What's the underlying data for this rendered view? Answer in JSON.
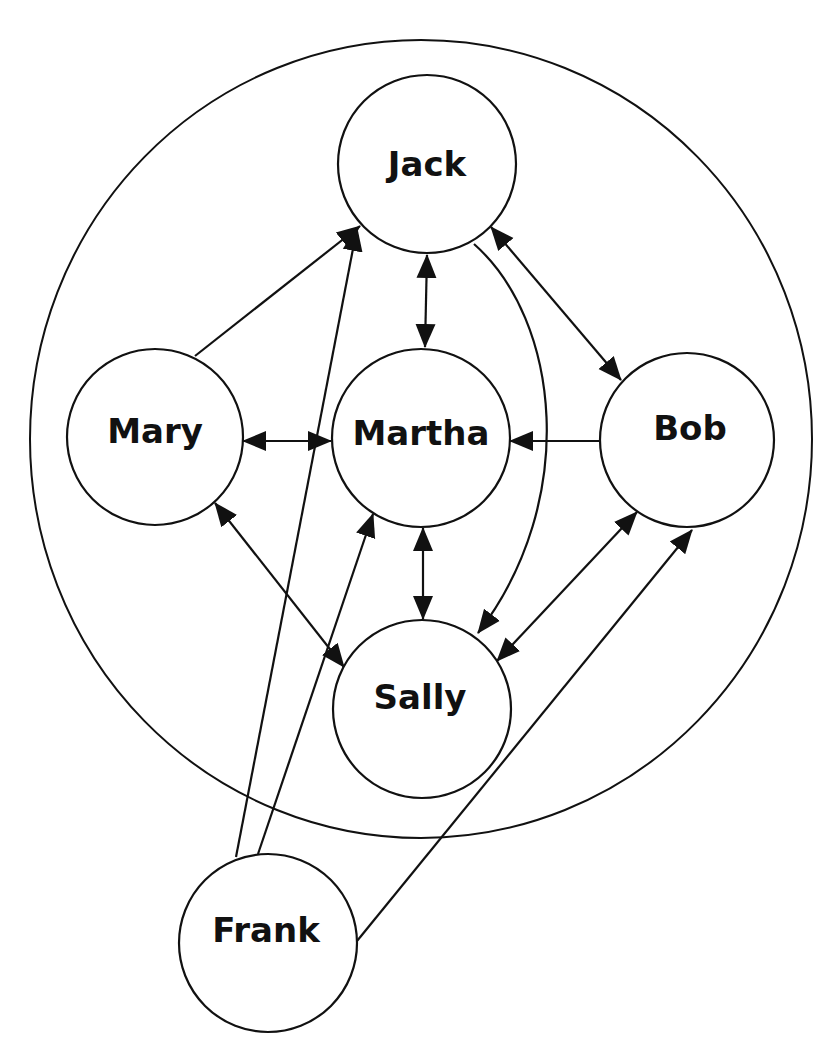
{
  "diagram": {
    "type": "social-network-graph",
    "colors": {
      "stroke": "#111111",
      "background": "#ffffff"
    },
    "group_boundary": {
      "cx": 421,
      "cy": 439,
      "rx": 391,
      "ry": 399
    },
    "nodes": [
      {
        "id": "jack",
        "label": "Jack",
        "cx": 427,
        "cy": 164,
        "r": 89,
        "inside_group": true
      },
      {
        "id": "mary",
        "label": "Mary",
        "cx": 155,
        "cy": 437,
        "r": 88,
        "inside_group": true
      },
      {
        "id": "martha",
        "label": "Martha",
        "cx": 421,
        "cy": 438,
        "r": 89,
        "inside_group": true
      },
      {
        "id": "bob",
        "label": "Bob",
        "cx": 687,
        "cy": 440,
        "r": 87,
        "inside_group": true
      },
      {
        "id": "sally",
        "label": "Sally",
        "cx": 422,
        "cy": 709,
        "r": 89,
        "inside_group": true
      },
      {
        "id": "frank",
        "label": "Frank",
        "cx": 268,
        "cy": 943,
        "r": 89,
        "inside_group": false
      }
    ],
    "edges": [
      {
        "from": "mary",
        "to": "jack",
        "direction": "one-way"
      },
      {
        "from": "frank",
        "to": "jack",
        "direction": "one-way"
      },
      {
        "from": "jack",
        "to": "martha",
        "direction": "two-way"
      },
      {
        "from": "jack",
        "to": "bob",
        "direction": "two-way"
      },
      {
        "from": "jack",
        "to": "sally",
        "direction": "one-way",
        "curved": true
      },
      {
        "from": "mary",
        "to": "martha",
        "direction": "two-way"
      },
      {
        "from": "bob",
        "to": "martha",
        "direction": "one-way"
      },
      {
        "from": "mary",
        "to": "sally",
        "direction": "two-way"
      },
      {
        "from": "frank",
        "to": "martha",
        "direction": "one-way"
      },
      {
        "from": "martha",
        "to": "sally",
        "direction": "two-way"
      },
      {
        "from": "bob",
        "to": "sally",
        "direction": "two-way"
      },
      {
        "from": "frank",
        "to": "bob",
        "direction": "one-way"
      }
    ]
  }
}
